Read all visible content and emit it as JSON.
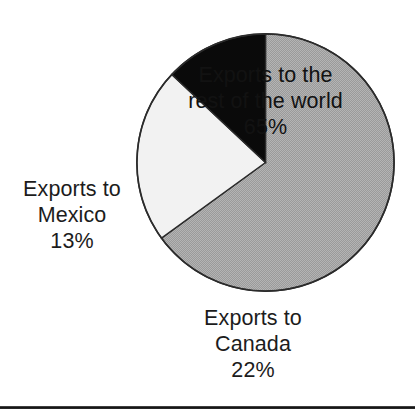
{
  "figure": {
    "kind": "pie-chart",
    "background_color": "#ffffff",
    "outline_color": "#2b2b2b",
    "bottom_rule_color": "#141414"
  },
  "chart_data": {
    "type": "pie",
    "title": "",
    "subtitle": "",
    "xlabel": "",
    "ylabel": "",
    "grid": false,
    "legend_position": "none",
    "units": "percent",
    "total": 100,
    "start_angle_deg": 270,
    "direction": "clockwise",
    "categories": [
      "Exports to the rest of the world",
      "Exports to Canada",
      "Exports to Mexico"
    ],
    "values": [
      65,
      22,
      13
    ],
    "value_labels": [
      "65%",
      "22%",
      "13%"
    ],
    "colors": [
      "#a8a8a8",
      "#f2f2f2",
      "#0a0a0a"
    ],
    "slices": [
      {
        "name": "Exports to the rest of the world",
        "value": 65,
        "value_label": "65%",
        "color": "#a8a8a8",
        "fill_style": "halftone-gray",
        "label_placement": "inside",
        "label_lines": [
          "Exports to the",
          "rest of the world",
          "65%"
        ],
        "start_angle_deg": 270,
        "end_angle_deg": 144
      },
      {
        "name": "Exports to Canada",
        "value": 22,
        "value_label": "22%",
        "color": "#f2f2f2",
        "fill_style": "white",
        "label_placement": "outside-bottom",
        "label_lines": [
          "Exports to",
          "Canada",
          "22%"
        ],
        "start_angle_deg": 144,
        "end_angle_deg": 223.2
      },
      {
        "name": "Exports to Mexico",
        "value": 13,
        "value_label": "13%",
        "color": "#0a0a0a",
        "fill_style": "black",
        "label_placement": "outside-left",
        "label_lines": [
          "Exports to",
          "Mexico",
          "13%"
        ],
        "start_angle_deg": 223.2,
        "end_angle_deg": 270
      }
    ]
  },
  "labels": {
    "world": {
      "line1": "Exports to the",
      "line2": "rest of the world",
      "line3": "65%"
    },
    "mexico": {
      "line1": "Exports to",
      "line2": "Mexico",
      "line3": "13%"
    },
    "canada": {
      "line1": "Exports to",
      "line2": "Canada",
      "line3": "22%"
    }
  }
}
